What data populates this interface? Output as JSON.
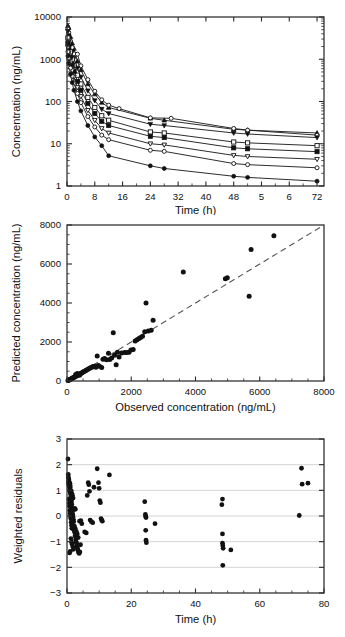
{
  "figure": {
    "caption_title": "Pharmacokinetic model evaluation",
    "panel_count": 3
  },
  "chart_data": [
    {
      "id": "panel-a",
      "type": "line",
      "title": "",
      "xlabel": "Time (h)",
      "ylabel": "Concentration (ng/mL)",
      "xlim": [
        0,
        74
      ],
      "ylim": [
        1,
        10000
      ],
      "yscale": "log",
      "xscale": "linear",
      "grid": false,
      "legend": "none",
      "xticks": [
        0,
        8,
        16,
        24,
        32,
        40,
        48,
        56,
        64,
        72
      ],
      "xtick_labels": [
        "0",
        "8",
        "16",
        "24",
        "32",
        "40",
        "48",
        "5",
        "6",
        "72"
      ],
      "yticks": [
        1,
        10,
        100,
        1000,
        10000
      ],
      "ytick_labels": [
        "1",
        "10",
        "100",
        "1000",
        "10000"
      ],
      "series": [
        {
          "name": "Dose group 1",
          "marker": "filled-triangle-up",
          "x": [
            0.25,
            0.5,
            1,
            1.5,
            2,
            3,
            4,
            6,
            8,
            10,
            12,
            24,
            28,
            48,
            52,
            72
          ],
          "y": [
            6200,
            5600,
            3400,
            2400,
            1800,
            900,
            560,
            260,
            150,
            95,
            72,
            40,
            36,
            22,
            21,
            18
          ]
        },
        {
          "name": "Dose group 2",
          "marker": "open-circle",
          "x": [
            0.25,
            0.5,
            1,
            1.5,
            2,
            3,
            4,
            6,
            8,
            10,
            12,
            15,
            24,
            30,
            48,
            52,
            72
          ],
          "y": [
            5200,
            4300,
            2700,
            1900,
            1350,
            1320,
            700,
            330,
            175,
            110,
            82,
            68,
            41,
            40,
            23,
            21,
            16
          ]
        },
        {
          "name": "Dose group 3",
          "marker": "filled-triangle-down",
          "x": [
            0.25,
            0.5,
            1,
            1.5,
            2,
            3,
            4,
            6,
            8,
            10,
            12,
            24,
            28,
            48,
            52,
            72
          ],
          "y": [
            4600,
            3600,
            2200,
            1500,
            1050,
            620,
            380,
            180,
            105,
            66,
            52,
            29,
            27,
            18,
            17,
            14
          ]
        },
        {
          "name": "Dose group 4",
          "marker": "open-square",
          "x": [
            0.25,
            0.5,
            1,
            1.5,
            2,
            3,
            4,
            6,
            8,
            10,
            12,
            24,
            28,
            48,
            52,
            72
          ],
          "y": [
            3200,
            2500,
            1500,
            1000,
            720,
            420,
            260,
            125,
            72,
            46,
            36,
            19,
            18,
            11,
            10.5,
            9.0
          ]
        },
        {
          "name": "Dose group 5",
          "marker": "filled-square",
          "x": [
            0.25,
            0.5,
            1,
            1.5,
            2,
            3,
            4,
            6,
            8,
            10,
            12,
            24,
            28,
            48,
            52,
            72
          ],
          "y": [
            2400,
            1850,
            1100,
            740,
            520,
            300,
            185,
            90,
            52,
            34,
            27,
            15,
            14,
            8.0,
            7.6,
            6.5
          ]
        },
        {
          "name": "Dose group 6",
          "marker": "open-triangle-down",
          "x": [
            0.25,
            0.5,
            1,
            1.5,
            2,
            3,
            4,
            6,
            8,
            10,
            12,
            24,
            28,
            48,
            52,
            72
          ],
          "y": [
            1900,
            1400,
            820,
            540,
            380,
            215,
            132,
            62,
            36,
            23,
            18,
            10.0,
            9.4,
            5.3,
            5.0,
            4.3
          ]
        },
        {
          "name": "Dose group 7",
          "marker": "open-circle",
          "x": [
            0.25,
            0.5,
            1,
            1.5,
            2,
            3,
            4,
            6,
            8,
            10,
            12,
            24,
            28,
            48,
            52,
            72
          ],
          "y": [
            1500,
            1050,
            620,
            400,
            275,
            155,
            94,
            44,
            25,
            16,
            12.5,
            7.0,
            6.6,
            3.4,
            3.2,
            2.7
          ]
        },
        {
          "name": "Dose group 8",
          "marker": "filled-circle",
          "x": [
            0.25,
            0.5,
            1,
            1.5,
            2,
            3,
            4,
            6,
            8,
            10,
            12,
            24,
            28,
            48,
            52,
            72
          ],
          "y": [
            1200,
            800,
            440,
            280,
            185,
            100,
            60,
            27,
            14.5,
            9.0,
            5.2,
            3.0,
            2.6,
            1.7,
            1.6,
            1.3
          ]
        }
      ]
    },
    {
      "id": "panel-b",
      "type": "scatter",
      "title": "",
      "xlabel": "Observed concentration (ng/mL)",
      "ylabel": "Predicted concentration (ng/mL)",
      "xlim": [
        0,
        8000
      ],
      "ylim": [
        0,
        8000
      ],
      "grid": false,
      "legend": "none",
      "xticks": [
        0,
        2000,
        4000,
        6000,
        8000
      ],
      "yticks": [
        0,
        2000,
        4000,
        6000,
        8000
      ],
      "reference_line": {
        "type": "identity",
        "style": "dashed",
        "from": [
          0,
          0
        ],
        "to": [
          8000,
          8000
        ]
      },
      "points": [
        [
          30,
          20
        ],
        [
          45,
          35
        ],
        [
          60,
          50
        ],
        [
          75,
          60
        ],
        [
          90,
          80
        ],
        [
          110,
          95
        ],
        [
          130,
          110
        ],
        [
          150,
          130
        ],
        [
          170,
          150
        ],
        [
          190,
          165
        ],
        [
          210,
          185
        ],
        [
          235,
          205
        ],
        [
          255,
          225
        ],
        [
          280,
          250
        ],
        [
          300,
          270
        ],
        [
          325,
          290
        ],
        [
          350,
          315
        ],
        [
          375,
          340
        ],
        [
          400,
          360
        ],
        [
          430,
          390
        ],
        [
          455,
          410
        ],
        [
          270,
          330
        ],
        [
          320,
          380
        ],
        [
          390,
          300
        ],
        [
          480,
          440
        ],
        [
          510,
          470
        ],
        [
          545,
          500
        ],
        [
          575,
          530
        ],
        [
          610,
          560
        ],
        [
          650,
          600
        ],
        [
          690,
          640
        ],
        [
          730,
          680
        ],
        [
          770,
          700
        ],
        [
          810,
          740
        ],
        [
          860,
          760
        ],
        [
          900,
          700
        ],
        [
          940,
          1280
        ],
        [
          975,
          790
        ],
        [
          1010,
          760
        ],
        [
          1080,
          690
        ],
        [
          1120,
          1120
        ],
        [
          1170,
          1160
        ],
        [
          1230,
          1090
        ],
        [
          1290,
          1420
        ],
        [
          1330,
          1100
        ],
        [
          1390,
          1180
        ],
        [
          1440,
          2480
        ],
        [
          1480,
          1320
        ],
        [
          1530,
          830
        ],
        [
          1570,
          1480
        ],
        [
          1620,
          1230
        ],
        [
          1700,
          1430
        ],
        [
          1790,
          1460
        ],
        [
          1860,
          1460
        ],
        [
          1930,
          1480
        ],
        [
          1990,
          1590
        ],
        [
          2060,
          1620
        ],
        [
          2120,
          2050
        ],
        [
          2180,
          2120
        ],
        [
          2240,
          2180
        ],
        [
          2290,
          2230
        ],
        [
          2350,
          2290
        ],
        [
          2420,
          2520
        ],
        [
          2460,
          4000
        ],
        [
          2530,
          2560
        ],
        [
          2620,
          2600
        ],
        [
          2680,
          3110
        ],
        [
          3620,
          5590
        ],
        [
          4930,
          5250
        ],
        [
          4990,
          5300
        ],
        [
          5670,
          4350
        ],
        [
          5730,
          6740
        ],
        [
          6440,
          7450
        ]
      ]
    },
    {
      "id": "panel-c",
      "type": "scatter",
      "title": "",
      "xlabel": "Time (h)",
      "ylabel": "Weighted residuals",
      "xlim": [
        0,
        80
      ],
      "ylim": [
        -3,
        3
      ],
      "grid": true,
      "legend": "none",
      "xticks": [
        0,
        20,
        40,
        60,
        80
      ],
      "yticks": [
        -3,
        -2,
        -1,
        0,
        1,
        2,
        3
      ],
      "points": [
        [
          0.3,
          2.22
        ],
        [
          0.4,
          1.62
        ],
        [
          0.5,
          1.46
        ],
        [
          0.5,
          1.28
        ],
        [
          0.6,
          1.4
        ],
        [
          0.7,
          1.14
        ],
        [
          0.8,
          1.02
        ],
        [
          0.9,
          0.96
        ],
        [
          1.0,
          1.1
        ],
        [
          1.1,
          0.86
        ],
        [
          1.2,
          0.74
        ],
        [
          1.3,
          0.62
        ],
        [
          1.4,
          0.55
        ],
        [
          1.5,
          0.44
        ],
        [
          1.6,
          0.3
        ],
        [
          1.7,
          0.18
        ],
        [
          1.8,
          0.06
        ],
        [
          1.9,
          -0.04
        ],
        [
          2.0,
          -0.14
        ],
        [
          2.1,
          -0.22
        ],
        [
          0.6,
          0.66
        ],
        [
          0.7,
          0.5
        ],
        [
          0.8,
          0.38
        ],
        [
          0.9,
          0.22
        ],
        [
          1.0,
          0.1
        ],
        [
          1.1,
          -0.02
        ],
        [
          1.2,
          -0.1
        ],
        [
          1.3,
          -0.24
        ],
        [
          1.4,
          -0.36
        ],
        [
          1.5,
          -0.48
        ],
        [
          0.4,
          1.52
        ],
        [
          0.5,
          1.34
        ],
        [
          0.6,
          1.2
        ],
        [
          0.9,
          1.28
        ],
        [
          1.0,
          1.18
        ],
        [
          1.1,
          0.92
        ],
        [
          1.3,
          0.98
        ],
        [
          1.5,
          0.88
        ],
        [
          1.7,
          0.8
        ],
        [
          1.9,
          0.7
        ],
        [
          2.2,
          -0.56
        ],
        [
          2.4,
          -0.64
        ],
        [
          2.5,
          -0.78
        ],
        [
          2.7,
          -0.92
        ],
        [
          2.8,
          -1.0
        ],
        [
          3.0,
          -1.06
        ],
        [
          3.1,
          -1.18
        ],
        [
          3.3,
          -1.26
        ],
        [
          3.4,
          -1.34
        ],
        [
          3.6,
          -1.42
        ],
        [
          2.3,
          -0.4
        ],
        [
          2.6,
          -0.5
        ],
        [
          2.9,
          -0.6
        ],
        [
          3.2,
          -0.7
        ],
        [
          3.5,
          -0.84
        ],
        [
          1.2,
          -0.88
        ],
        [
          1.4,
          -1.02
        ],
        [
          1.6,
          -1.1
        ],
        [
          1.8,
          -1.2
        ],
        [
          2.0,
          -1.3
        ],
        [
          0.8,
          -1.44
        ],
        [
          1.0,
          -1.38
        ],
        [
          3.8,
          -1.46
        ],
        [
          4.0,
          -1.4
        ],
        [
          4.2,
          -1.12
        ],
        [
          3.9,
          -0.2
        ],
        [
          4.3,
          -0.18
        ],
        [
          4.6,
          -0.3
        ],
        [
          2.4,
          0.3
        ],
        [
          2.6,
          0.26
        ],
        [
          5.5,
          -0.62
        ],
        [
          6.0,
          -0.66
        ],
        [
          6.3,
          0.8
        ],
        [
          6.6,
          1.3
        ],
        [
          6.8,
          1.22
        ],
        [
          7.0,
          0.96
        ],
        [
          7.2,
          -0.16
        ],
        [
          7.6,
          -0.22
        ],
        [
          8.0,
          -0.26
        ],
        [
          8.4,
          1.12
        ],
        [
          9.4,
          1.84
        ],
        [
          9.8,
          1.3
        ],
        [
          10.0,
          1.08
        ],
        [
          10.2,
          0.6
        ],
        [
          10.4,
          0.52
        ],
        [
          10.6,
          -0.1
        ],
        [
          10.8,
          -0.16
        ],
        [
          11.0,
          -0.2
        ],
        [
          13.2,
          1.6
        ],
        [
          24.2,
          0.56
        ],
        [
          24.4,
          0.06
        ],
        [
          24.5,
          -0.02
        ],
        [
          24.6,
          -0.06
        ],
        [
          24.5,
          -0.56
        ],
        [
          24.6,
          -0.94
        ],
        [
          24.7,
          -1.04
        ],
        [
          27.4,
          -0.3
        ],
        [
          48.4,
          0.66
        ],
        [
          48.2,
          0.44
        ],
        [
          48.4,
          -0.7
        ],
        [
          48.4,
          -1.06
        ],
        [
          48.5,
          -1.16
        ],
        [
          48.6,
          -1.26
        ],
        [
          48.5,
          -1.92
        ],
        [
          51.0,
          -1.32
        ],
        [
          72.3,
          0.02
        ],
        [
          73.0,
          1.86
        ],
        [
          73.2,
          1.24
        ],
        [
          75.0,
          1.28
        ]
      ]
    }
  ]
}
